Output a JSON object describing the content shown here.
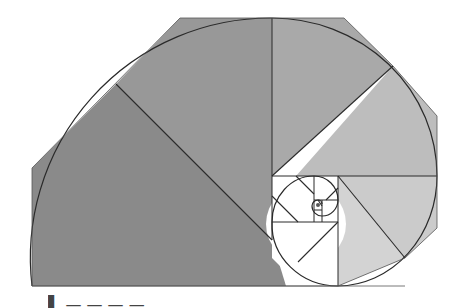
{
  "figure": {
    "colors": {
      "square_1": "#8a8a8a",
      "square_2": "#989898",
      "square_3": "#a6a6a6",
      "square_4": "#bcbcbc",
      "square_5": "#cacaca",
      "square_6": "#d6d6d6",
      "inner": "#ffffff",
      "stroke": "#2a2a2a"
    }
  },
  "caption": {
    "text": "▌           —  —      —  —"
  }
}
